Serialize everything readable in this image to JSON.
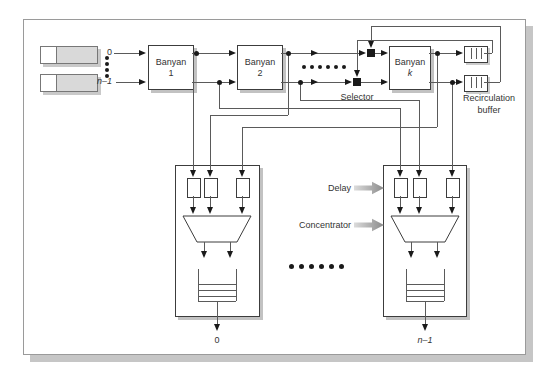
{
  "figure": {
    "input_labels": {
      "first": "0",
      "last": "n–1"
    },
    "banyans": [
      {
        "line1": "Banyan",
        "line2": "1"
      },
      {
        "line1": "Banyan",
        "line2": "2"
      },
      {
        "line1": "Banyan",
        "line2": "k"
      }
    ],
    "selector_label": "Selector",
    "recirculation": {
      "line1": "Recirculation",
      "line2": "buffer"
    },
    "callouts": {
      "delay": "Delay",
      "concentrator": "Concentrator"
    },
    "output_labels": {
      "first": "0",
      "last": "n–1"
    },
    "colors": {
      "wire": "#5a5a5a",
      "box_border": "#3c3c3c",
      "drop_shadow": "#c2c2c2",
      "queue_fill": "#d9d9d9",
      "marker": "#1a1a1a"
    }
  }
}
